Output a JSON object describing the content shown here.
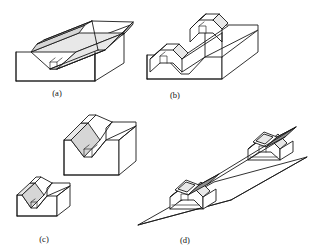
{
  "figure": {
    "background_color": "#ffffff",
    "line_color": "#1a1a1a",
    "shade_color": "#e8e8e8",
    "width": 310,
    "height": 251,
    "panels": [
      {
        "id": "a",
        "caption": "(a)",
        "caption_x": 57,
        "caption_y": 96,
        "description": "Rectangular block with a V-groove machined along its full length, with a small square relief slot at the groove root"
      },
      {
        "id": "b",
        "caption": "(b)",
        "caption_x": 175,
        "caption_y": 98,
        "description": "V-block with the V-groove running across the width, showing the relief slot at the apex of the V"
      },
      {
        "id": "c",
        "caption": "(c)",
        "caption_x": 44,
        "caption_y": 242,
        "description": "Two V-blocks of different sizes, a large one above and a smaller one below"
      },
      {
        "id": "d",
        "caption": "(d)",
        "caption_x": 185,
        "caption_y": 243,
        "description": "Two V-blocks mounted on a flat base plate, each cradling a square bar in its V-groove"
      }
    ]
  }
}
